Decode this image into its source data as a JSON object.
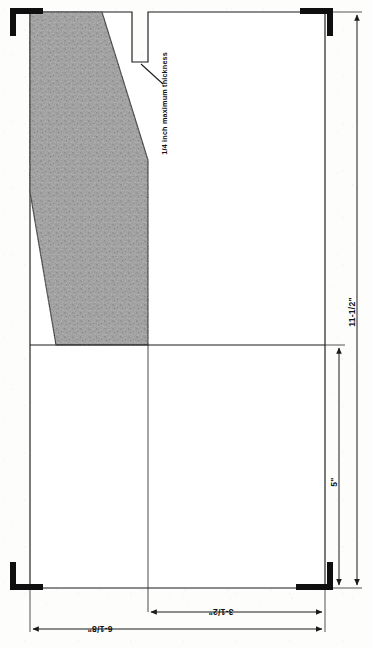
{
  "drawing": {
    "title": "Flat pattern template with hatched cut-away region",
    "background_color": "#fdfdfc",
    "line_color": "#1a1a1a",
    "shaded_fill_color": "#9a9a9a",
    "corner_mark_color": "#0f0f0f"
  },
  "annotations": {
    "thickness_note": "1/4 inch maximum thickness"
  },
  "dimensions": {
    "height_total": "11-1/2\"",
    "height_lower": "5\"",
    "width_inner": "3-1/2\"",
    "width_total": "6-1/8\""
  },
  "geometry": {
    "outline_label": "main-outline",
    "notch_label": "top-notch",
    "shaded_region_label": "shaded-cutaway",
    "divider_label": "horizontal-divider",
    "corner_marks": [
      "corner-mark-top-left",
      "corner-mark-top-right",
      "corner-mark-bottom-left",
      "corner-mark-bottom-right"
    ]
  }
}
